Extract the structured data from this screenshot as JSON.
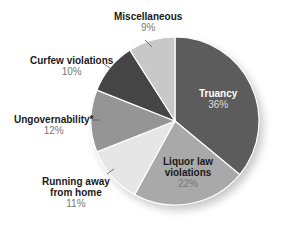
{
  "chart_data": {
    "type": "pie",
    "title": "",
    "categories": [
      "Truancy",
      "Liquor law violations",
      "Running away from home",
      "Ungovernability*",
      "Curfew violations",
      "Miscellaneous"
    ],
    "values": [
      36,
      22,
      11,
      12,
      10,
      9
    ],
    "unit": "%",
    "colors": [
      "#5c5c5c",
      "#a9a9a9",
      "#e6e6e6",
      "#959595",
      "#454545",
      "#c8c8c8"
    ]
  },
  "labels": {
    "truancy": {
      "name": "Truancy",
      "pct": "36%"
    },
    "liquor_1": "Liquor law",
    "liquor_2": "violations",
    "liquor_pct": "22%",
    "running_1": "Running away",
    "running_2": "from home",
    "running_pct": "11%",
    "ungov": {
      "name": "Ungovernability*",
      "pct": "12%"
    },
    "curfew": {
      "name": "Curfew violations",
      "pct": "10%"
    },
    "misc": {
      "name": "Miscellaneous",
      "pct": "9%"
    }
  }
}
